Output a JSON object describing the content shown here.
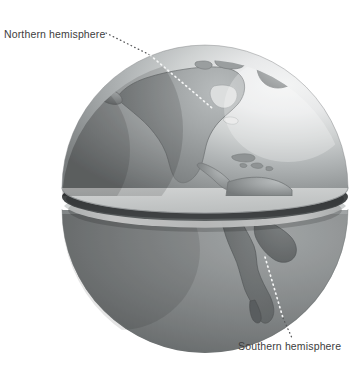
{
  "figure": {
    "background_color": "#ffffff",
    "width": 353,
    "height": 366
  },
  "labels": {
    "northern": {
      "text": "Northern hemisphere",
      "icon": "text-label",
      "leader": "dotted-leader-line",
      "leader_target": "north-america"
    },
    "southern": {
      "text": "Southern hemisphere",
      "icon": "text-label",
      "leader": "dotted-leader-line",
      "leader_target": "south-america"
    }
  },
  "globe": {
    "center_x": 205,
    "center_y": 180,
    "radius": 143,
    "equator_split_y": 203,
    "northern_hemisphere": {
      "name": "northern-hemisphere-dome",
      "cut_face": "equatorial-cut-plane",
      "landmasses": [
        "North America",
        "Greenland",
        "Central America",
        "Caribbean"
      ]
    },
    "southern_hemisphere": {
      "name": "southern-hemisphere-bowl",
      "landmasses": [
        "South America"
      ]
    },
    "colors": {
      "ocean_light": "#eceded",
      "ocean_mid": "#b9bcbd",
      "ocean_dark": "#7f8384",
      "land": "#8c9091",
      "land_dark": "#6e7273",
      "land_light": "#a8acad",
      "cut_face": "#d4d6d6",
      "shadow_gap": "#3a3d3e",
      "outline": "#6b6f70",
      "leader_outside": "#58595b",
      "leader_inside": "#f4f5f5",
      "text": "#3d3d3d"
    }
  }
}
